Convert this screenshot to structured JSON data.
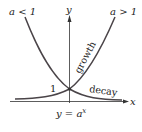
{
  "diagram": {
    "labels": {
      "decay_condition": "a < 1",
      "growth_condition": "a > 1",
      "y_axis": "y",
      "x_axis": "x",
      "intercept": "1",
      "growth": "growth",
      "decay": "decay",
      "formula_lhs": "y = a",
      "formula_exp": "x"
    },
    "colors": {
      "curve": "#4a4448",
      "axis": "#333333",
      "text": "#222222",
      "background": "#ffffff"
    },
    "curves": [
      {
        "name": "growth",
        "condition": "a > 1",
        "passes_through": [
          0,
          1
        ]
      },
      {
        "name": "decay",
        "condition": "a < 1",
        "passes_through": [
          0,
          1
        ]
      }
    ]
  }
}
